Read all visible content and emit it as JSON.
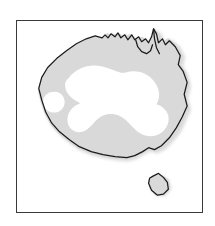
{
  "figure": {
    "kind": "map",
    "caption": "",
    "frame": {
      "border_color": "#3a3a3a",
      "border_width_px": 1.5,
      "background_color": "#ffffff",
      "x": 16,
      "y": 20,
      "width": 187,
      "height": 193
    }
  },
  "map": {
    "region_name": "Australia",
    "projection_note": "simplified outline",
    "layers": [
      {
        "id": "distribution-shading",
        "label": "shaded distribution area",
        "fill_color": "#d9d9d9",
        "description": "grey band covering the coastal and northern margins of the continent and Tasmania"
      },
      {
        "id": "unshaded-interior",
        "label": "unshaded arid interior",
        "fill_color": "#ffffff",
        "description": "white irregular interior region covering central and western inland Australia"
      },
      {
        "id": "coastline",
        "label": "coastline outline",
        "stroke_color": "#1a1a1a",
        "stroke_width_px": 1.2
      }
    ],
    "landmasses": [
      {
        "id": "mainland",
        "label": "Australian mainland"
      },
      {
        "id": "tasmania",
        "label": "Tasmania"
      }
    ],
    "features": [
      {
        "id": "cape-york",
        "label": "Cape York Peninsula"
      },
      {
        "id": "gulf-of-carpentaria",
        "label": "Gulf of Carpentaria"
      },
      {
        "id": "great-australian-bight",
        "label": "Great Australian Bight"
      },
      {
        "id": "bass-strait",
        "label": "Bass Strait"
      }
    ]
  },
  "colors": {
    "shading": "#d9d9d9",
    "shading_soft": "#e4e4e4",
    "coastline": "#1a1a1a",
    "frame": "#3a3a3a",
    "page_background": "#ffffff"
  }
}
